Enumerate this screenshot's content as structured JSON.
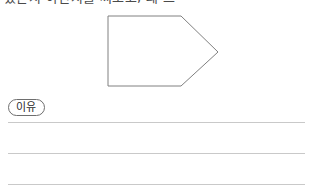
{
  "page": {
    "background_color": "#ffffff",
    "width": 313,
    "height": 194
  },
  "header": {
    "text": "있는지 아닌지를 써보고, 왜 그",
    "color": "#4a4a4a",
    "note_visible": "partially cropped at top edge"
  },
  "figure": {
    "name": "pentagon-arrow-shape",
    "stroke_color": "#808080",
    "fill_color": "#ffffff",
    "stroke_width": 1,
    "points": "108,9 181,9 218,45 181,79 108,79",
    "vertex_count": 5
  },
  "reason_section": {
    "label": "이유",
    "label_border_color": "#6e6e6e",
    "label_text_color": "#2b2b2b"
  },
  "answer_lines": {
    "color": "#c9c9c9",
    "count": 3,
    "lines": [
      {
        "y": 122
      },
      {
        "y": 153
      },
      {
        "y": 184
      }
    ]
  }
}
